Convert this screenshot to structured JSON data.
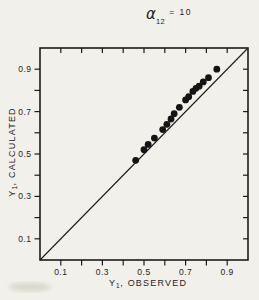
{
  "figure": {
    "title": {
      "alpha": "α",
      "alpha_subscript": "12",
      "equation_rest": "= 10"
    },
    "y_axis_title": {
      "prefix": "Y",
      "subscript": "1",
      "suffix": ", CALCULATED"
    },
    "x_axis_title": {
      "prefix": "Y",
      "subscript": "1",
      "suffix": ", OBSERVED"
    }
  },
  "chart_data": {
    "type": "scatter",
    "xlabel": "Y1, OBSERVED",
    "ylabel": "Y1, CALCULATED",
    "xlim": [
      0,
      1
    ],
    "ylim": [
      0,
      1
    ],
    "grid": false,
    "x_ticks": [
      0.1,
      0.2,
      0.3,
      0.4,
      0.5,
      0.6,
      0.7,
      0.8,
      0.9
    ],
    "y_ticks": [
      0.1,
      0.2,
      0.3,
      0.4,
      0.5,
      0.6,
      0.7,
      0.8,
      0.9
    ],
    "labeled_tick_values": [
      0.1,
      0.3,
      0.5,
      0.7,
      0.9
    ],
    "x_tick_labels": [
      "0.1",
      "0.3",
      "0.5",
      "0.7",
      "0.9"
    ],
    "y_tick_labels": [
      "0.1",
      "0.3",
      "0.5",
      "0.7",
      "0.9"
    ],
    "reference_line": {
      "type": "identity",
      "from": [
        0,
        0
      ],
      "to": [
        1,
        1
      ]
    },
    "series": [
      {
        "name": "calculated vs observed",
        "points": [
          [
            0.46,
            0.47
          ],
          [
            0.5,
            0.52
          ],
          [
            0.52,
            0.545
          ],
          [
            0.55,
            0.575
          ],
          [
            0.59,
            0.615
          ],
          [
            0.61,
            0.64
          ],
          [
            0.63,
            0.665
          ],
          [
            0.645,
            0.69
          ],
          [
            0.67,
            0.72
          ],
          [
            0.7,
            0.755
          ],
          [
            0.715,
            0.77
          ],
          [
            0.735,
            0.795
          ],
          [
            0.75,
            0.81
          ],
          [
            0.765,
            0.82
          ],
          [
            0.785,
            0.84
          ],
          [
            0.81,
            0.86
          ],
          [
            0.85,
            0.9
          ]
        ]
      }
    ]
  },
  "colors": {
    "paper": "#f2f0ea",
    "ink": "#1c1c1c",
    "point": "#141414",
    "smudge": "#b3ac9e"
  }
}
